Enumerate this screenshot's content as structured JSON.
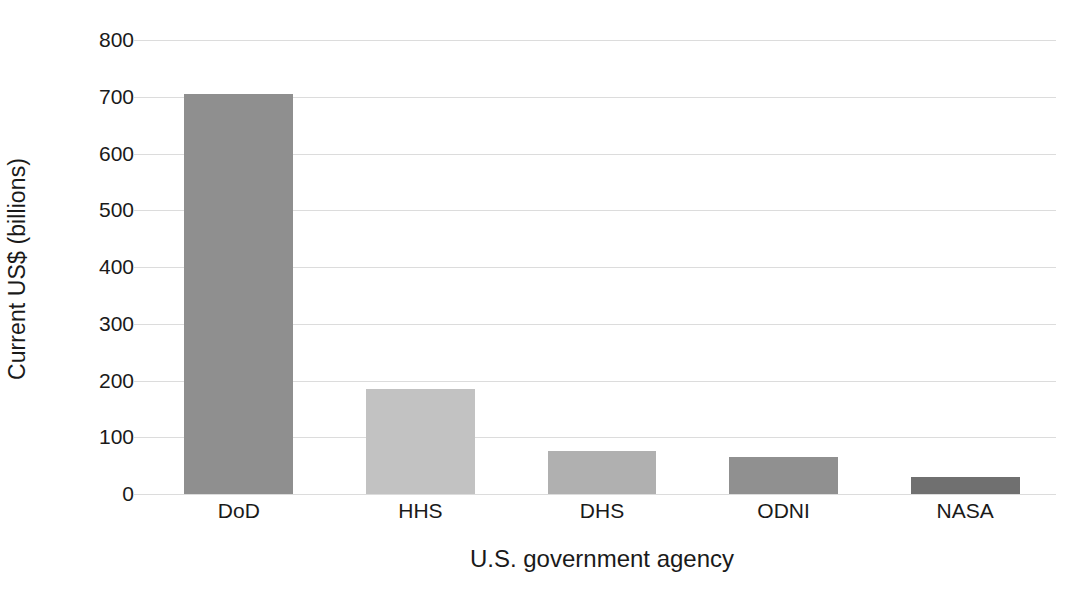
{
  "chart_data": {
    "type": "bar",
    "title": "",
    "subtitle": "",
    "xlabel": "U.S. government agency",
    "ylabel": "Current US$ (billions)",
    "categories": [
      "DoD",
      "HHS",
      "DHS",
      "ODNI",
      "NASA"
    ],
    "values": [
      705,
      185,
      75,
      65,
      30
    ],
    "bar_colors": [
      "#8f8f8f",
      "#c2c2c2",
      "#b0b0b0",
      "#909090",
      "#707070"
    ],
    "ylim": [
      0,
      800
    ],
    "yticks": [
      0,
      100,
      200,
      300,
      400,
      500,
      600,
      700,
      800
    ],
    "ytick_labels": [
      "0",
      "100",
      "200",
      "300",
      "400",
      "500",
      "600",
      "700",
      "800"
    ],
    "grid": true,
    "grid_axis": "y",
    "grid_color": "#dcdcdc",
    "legend": false,
    "legend_position": "none",
    "background_color": "#ffffff",
    "text_color": "#1a1a1a",
    "series": [
      {
        "name": "Budget",
        "values": [
          705,
          185,
          75,
          65,
          30
        ]
      }
    ]
  }
}
